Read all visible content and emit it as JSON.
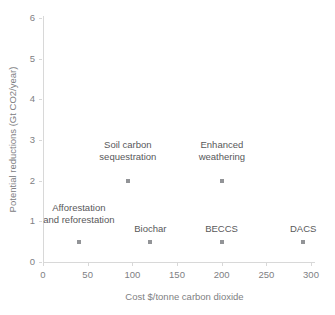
{
  "chart_data": {
    "type": "scatter",
    "title": "",
    "xlabel": "Cost $/tonne carbon dioxide",
    "ylabel": "Potential reductions (Gt CO2/year)",
    "xlim": [
      0,
      310
    ],
    "ylim": [
      0,
      6.1
    ],
    "xticks": [
      0,
      50,
      100,
      150,
      200,
      250,
      300
    ],
    "xtick_labels": [
      "0",
      "50",
      "100",
      "150",
      "200",
      "250",
      "300"
    ],
    "yticks": [
      0,
      1,
      2,
      3,
      4,
      5,
      6
    ],
    "ytick_labels": [
      "0",
      "1",
      "2",
      "3",
      "4",
      "5",
      "6"
    ],
    "grid": false,
    "legend": false,
    "marker_color": "#929497",
    "marker_shape": "square",
    "points": [
      {
        "label_lines": [
          "Afforestation",
          "and reforestation"
        ],
        "label": "Afforestation and reforestation",
        "x": 40,
        "y": 0.5,
        "label_x": 40,
        "label_y": 1.0,
        "label_align": "center"
      },
      {
        "label_lines": [
          "Biochar"
        ],
        "label": "Biochar",
        "x": 120,
        "y": 0.5,
        "label_x": 120,
        "label_y": 0.78,
        "label_align": "center"
      },
      {
        "label_lines": [
          "BECCS"
        ],
        "label": "BECCS",
        "x": 200,
        "y": 0.5,
        "label_x": 200,
        "label_y": 0.78,
        "label_align": "center"
      },
      {
        "label_lines": [
          "DACS"
        ],
        "label": "DACS",
        "x": 291,
        "y": 0.5,
        "label_x": 291,
        "label_y": 0.78,
        "label_align": "center"
      },
      {
        "label_lines": [
          "Soil carbon",
          "sequestration"
        ],
        "label": "Soil carbon sequestration",
        "x": 95,
        "y": 2.0,
        "label_x": 95,
        "label_y": 2.55,
        "label_align": "center"
      },
      {
        "label_lines": [
          "Enhanced",
          "weathering"
        ],
        "label": "Enhanced weathering",
        "x": 200,
        "y": 2.0,
        "label_x": 200,
        "label_y": 2.55,
        "label_align": "center"
      }
    ],
    "colors": {
      "background": "#ffffff",
      "axis": "#d8d8d8",
      "tick_text": "#808083",
      "label_text": "#58585a",
      "marker": "#929497"
    }
  }
}
